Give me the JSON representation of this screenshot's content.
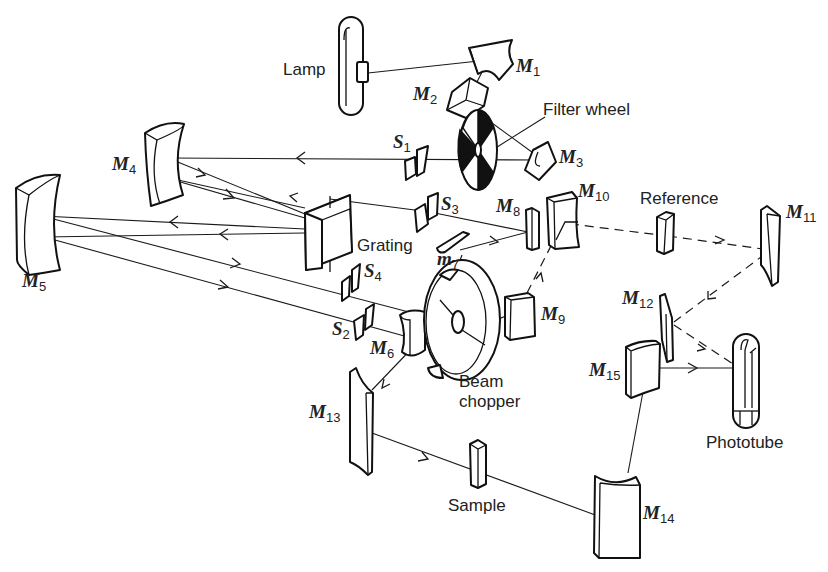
{
  "labels": {
    "lamp": "Lamp",
    "filter_wheel": "Filter wheel",
    "grating": "Grating",
    "reference": "Reference",
    "beam_chopper_line1": "Beam",
    "beam_chopper_line2": "chopper",
    "phototube": "Phototube",
    "sample": "Sample"
  },
  "mirrors": [
    {
      "id": "M1",
      "letter": "M",
      "sub": "1"
    },
    {
      "id": "M2",
      "letter": "M",
      "sub": "2"
    },
    {
      "id": "M3",
      "letter": "M",
      "sub": "3"
    },
    {
      "id": "M4",
      "letter": "M",
      "sub": "4"
    },
    {
      "id": "M5",
      "letter": "M",
      "sub": "5"
    },
    {
      "id": "M6",
      "letter": "M",
      "sub": "6"
    },
    {
      "id": "m7",
      "letter": "m",
      "sub": "7"
    },
    {
      "id": "M8",
      "letter": "M",
      "sub": "8"
    },
    {
      "id": "M9",
      "letter": "M",
      "sub": "9"
    },
    {
      "id": "M10",
      "letter": "M",
      "sub": "10"
    },
    {
      "id": "M11",
      "letter": "M",
      "sub": "11"
    },
    {
      "id": "M12",
      "letter": "M",
      "sub": "12"
    },
    {
      "id": "M13",
      "letter": "M",
      "sub": "13"
    },
    {
      "id": "M14",
      "letter": "M",
      "sub": "14"
    },
    {
      "id": "M15",
      "letter": "M",
      "sub": "15"
    }
  ],
  "slits": [
    {
      "id": "S1",
      "letter": "S",
      "sub": "1"
    },
    {
      "id": "S2",
      "letter": "S",
      "sub": "2"
    },
    {
      "id": "S3",
      "letter": "S",
      "sub": "3"
    },
    {
      "id": "S4",
      "letter": "S",
      "sub": "4"
    }
  ],
  "colors": {
    "ink": "#111111",
    "background": "#ffffff"
  }
}
